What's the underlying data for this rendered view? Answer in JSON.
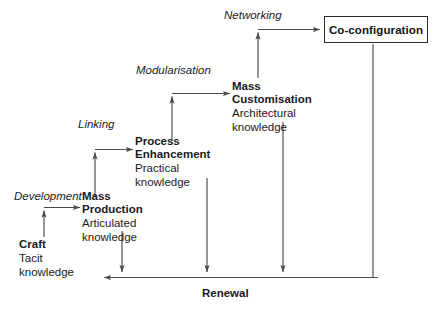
{
  "diagram": {
    "title": "Renewal",
    "stage_labels": [
      {
        "id": "development",
        "text": "Development"
      },
      {
        "id": "linking",
        "text": "Linking"
      },
      {
        "id": "modularisation",
        "text": "Modularisation"
      },
      {
        "id": "networking",
        "text": "Networking"
      }
    ],
    "nodes": [
      {
        "id": "craft",
        "title": "Craft",
        "sub_line1": "Tacit",
        "sub_line2": "knowledge"
      },
      {
        "id": "mass-production",
        "title_line1": "Mass",
        "title_line2": "Production",
        "sub_line1": "Articulated",
        "sub_line2": "knowledge"
      },
      {
        "id": "process-enhancement",
        "title_line1": "Process",
        "title_line2": "Enhancement",
        "sub_line1": "Practical",
        "sub_line2": "knowledge"
      },
      {
        "id": "mass-customisation",
        "title_line1": "Mass",
        "title_line2": "Customisation",
        "sub_line1": "Architectural",
        "sub_line2": "knowledge"
      },
      {
        "id": "co-configuration",
        "title": "Co-configuration",
        "boxed": true
      }
    ],
    "bottom_axis_label": "Renewal",
    "colors": {
      "line": "#4a4a4a",
      "text": "#1a1a1a",
      "box_border": "#2b2b2b",
      "background": "#ffffff"
    }
  }
}
